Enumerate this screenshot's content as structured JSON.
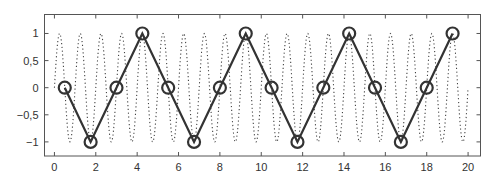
{
  "chart_data": {
    "type": "line",
    "title": "",
    "xlabel": "",
    "ylabel": "",
    "xlim": [
      -0.48,
      20.6
    ],
    "ylim": [
      -1.26,
      1.35
    ],
    "grid": false,
    "legend": null,
    "x_ticks": [
      0,
      2,
      4,
      6,
      8,
      10,
      12,
      14,
      16,
      18,
      20
    ],
    "x_tick_labels": [
      "0",
      "2",
      "4",
      "6",
      "8",
      "10",
      "12",
      "14",
      "16",
      "18",
      "20"
    ],
    "y_ticks": [
      1,
      0.5,
      0,
      -0.5,
      -1
    ],
    "y_tick_labels": [
      "1",
      "0,5",
      "0",
      "−0,5",
      "−1"
    ],
    "series": [
      {
        "name": "continuous signal",
        "style": "dotted",
        "function": "sin(2*pi*t)",
        "t_range": [
          0,
          20
        ],
        "frequency": 1,
        "color": "#444444"
      },
      {
        "name": "sampled signal",
        "style": "solid line with circle markers",
        "color": "#333333",
        "x": [
          0.5,
          1.75,
          3.0,
          4.25,
          5.5,
          6.75,
          8.0,
          9.25,
          10.5,
          11.75,
          13.0,
          14.25,
          15.5,
          16.75,
          18.0,
          19.25
        ],
        "y": [
          0,
          -1,
          0,
          1,
          0,
          -1,
          0,
          1,
          0,
          -1,
          0,
          1,
          0,
          -1,
          0,
          1
        ]
      }
    ]
  }
}
